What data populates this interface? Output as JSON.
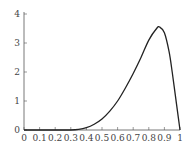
{
  "chart_data": {
    "type": "line",
    "title": "",
    "xlabel": "",
    "ylabel": "",
    "xlim": [
      0,
      1
    ],
    "ylim": [
      0,
      4
    ],
    "grid": false,
    "legend": null,
    "x_ticks": [
      "0",
      "0.1",
      "0.2",
      "0.3",
      "0.4",
      "0.5",
      "0.6",
      "0.7",
      "0.8",
      "0.9",
      "1"
    ],
    "y_ticks": [
      "0",
      "1",
      "2",
      "3",
      "4"
    ],
    "series": [
      {
        "name": "density",
        "color": "#222222",
        "x": [
          0,
          0.1,
          0.2,
          0.3,
          0.35,
          0.4,
          0.45,
          0.5,
          0.55,
          0.6,
          0.65,
          0.7,
          0.75,
          0.8,
          0.85,
          0.87,
          0.9,
          0.93,
          0.95,
          0.97,
          0.99,
          1
        ],
        "y": [
          0,
          0,
          0,
          0,
          0.02,
          0.08,
          0.2,
          0.38,
          0.65,
          1.0,
          1.45,
          1.95,
          2.5,
          3.1,
          3.5,
          3.55,
          3.35,
          2.7,
          2.0,
          1.2,
          0.4,
          0
        ]
      }
    ],
    "peak": {
      "x": 0.87,
      "y": 3.55
    }
  },
  "colors": {
    "axis": "#555555",
    "curve": "#222222",
    "background": "#ffffff"
  }
}
